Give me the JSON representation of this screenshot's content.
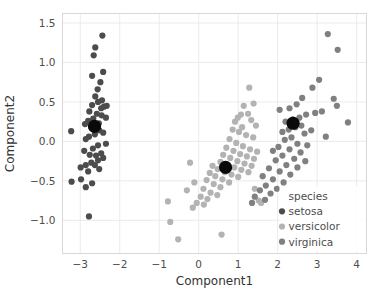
{
  "chart_data": {
    "type": "scatter",
    "title": "",
    "xlabel": "Component1",
    "ylabel": "Component2",
    "xlim": [
      -3.45,
      4.25
    ],
    "ylim": [
      -1.42,
      1.62
    ],
    "xticks": [
      -3,
      -2,
      -1,
      0,
      1,
      2,
      3,
      4
    ],
    "xticklabels": [
      "−3",
      "−2",
      "−1",
      "0",
      "1",
      "2",
      "3",
      "4"
    ],
    "yticks": [
      -1.0,
      -0.5,
      0.0,
      0.5,
      1.0,
      1.5
    ],
    "yticklabels": [
      "−1.0",
      "−0.5",
      "0.0",
      "0.5",
      "1.0",
      "1.5"
    ],
    "grid": true,
    "legend": {
      "title": "species",
      "position": "lower-right",
      "entries": [
        {
          "name": "setosa",
          "color": "#4c4c4c"
        },
        {
          "name": "versicolor",
          "color": "#b3b3b3"
        },
        {
          "name": "virginica",
          "color": "#808080"
        }
      ]
    },
    "marker_size": 3.1,
    "centroid_size": 6.6,
    "centroid_color": "#0a0a0a",
    "series": [
      {
        "name": "setosa",
        "color": "#4c4c4c",
        "points": [
          [
            -2.44,
            1.34
          ],
          [
            -2.62,
            1.19
          ],
          [
            -2.66,
            1.09
          ],
          [
            -2.7,
            0.83
          ],
          [
            -2.42,
            0.88
          ],
          [
            -2.49,
            0.75
          ],
          [
            -2.56,
            0.66
          ],
          [
            -2.62,
            0.57
          ],
          [
            -2.45,
            0.52
          ],
          [
            -2.33,
            0.45
          ],
          [
            -2.4,
            0.44
          ],
          [
            -2.55,
            0.5
          ],
          [
            -2.7,
            0.46
          ],
          [
            -2.77,
            0.38
          ],
          [
            -2.58,
            0.35
          ],
          [
            -2.46,
            0.33
          ],
          [
            -2.35,
            0.3
          ],
          [
            -2.67,
            0.29
          ],
          [
            -2.8,
            0.26
          ],
          [
            -2.88,
            0.22
          ],
          [
            -2.72,
            0.19
          ],
          [
            -2.6,
            0.17
          ],
          [
            -2.52,
            0.14
          ],
          [
            -3.23,
            0.13
          ],
          [
            -2.42,
            0.11
          ],
          [
            -2.63,
            0.09
          ],
          [
            -2.78,
            0.06
          ],
          [
            -2.86,
            0.03
          ],
          [
            -2.35,
            -0.03
          ],
          [
            -2.55,
            -0.05
          ],
          [
            -2.68,
            -0.09
          ],
          [
            -2.9,
            -0.12
          ],
          [
            -2.76,
            -0.17
          ],
          [
            -2.6,
            -0.18
          ],
          [
            -2.47,
            -0.15
          ],
          [
            -2.42,
            -0.21
          ],
          [
            -2.55,
            -0.24
          ],
          [
            -2.72,
            -0.27
          ],
          [
            -2.86,
            -0.3
          ],
          [
            -2.99,
            -0.33
          ],
          [
            -2.63,
            -0.3
          ],
          [
            -2.52,
            -0.35
          ],
          [
            -2.8,
            -0.38
          ],
          [
            -3.22,
            -0.51
          ],
          [
            -2.98,
            -0.48
          ],
          [
            -2.86,
            -0.58
          ],
          [
            -2.7,
            -0.53
          ],
          [
            -2.78,
            -0.95
          ],
          [
            -2.47,
            0.42
          ],
          [
            -2.53,
            0.23
          ]
        ]
      },
      {
        "name": "versicolor",
        "color": "#b3b3b3",
        "points": [
          [
            1.28,
            0.68
          ],
          [
            1.39,
            0.48
          ],
          [
            1.14,
            0.45
          ],
          [
            1.25,
            0.35
          ],
          [
            1.07,
            0.34
          ],
          [
            0.99,
            0.3
          ],
          [
            0.92,
            0.25
          ],
          [
            1.33,
            0.27
          ],
          [
            1.45,
            0.2
          ],
          [
            1.1,
            0.18
          ],
          [
            0.86,
            0.15
          ],
          [
            1.02,
            0.12
          ],
          [
            1.2,
            0.08
          ],
          [
            1.38,
            0.05
          ],
          [
            0.78,
            0.03
          ],
          [
            0.95,
            -0.02
          ],
          [
            1.12,
            -0.06
          ],
          [
            1.3,
            -0.1
          ],
          [
            1.48,
            -0.13
          ],
          [
            0.7,
            -0.08
          ],
          [
            0.88,
            -0.12
          ],
          [
            1.05,
            -0.16
          ],
          [
            1.22,
            -0.19
          ],
          [
            1.4,
            -0.22
          ],
          [
            0.62,
            -0.17
          ],
          [
            0.8,
            -0.21
          ],
          [
            0.98,
            -0.25
          ],
          [
            1.16,
            -0.28
          ],
          [
            1.34,
            -0.31
          ],
          [
            0.55,
            -0.26
          ],
          [
            0.73,
            -0.3
          ],
          [
            0.9,
            -0.33
          ],
          [
            1.08,
            -0.36
          ],
          [
            1.26,
            -0.39
          ],
          [
            0.35,
            -0.31
          ],
          [
            0.48,
            -0.35
          ],
          [
            0.66,
            -0.39
          ],
          [
            0.83,
            -0.42
          ],
          [
            1.0,
            -0.45
          ],
          [
            0.28,
            -0.4
          ],
          [
            0.42,
            -0.44
          ],
          [
            0.6,
            -0.48
          ],
          [
            0.77,
            -0.52
          ],
          [
            0.2,
            -0.49
          ],
          [
            0.38,
            -0.54
          ],
          [
            0.55,
            -0.58
          ],
          [
            0.12,
            -0.6
          ],
          [
            0.3,
            -0.65
          ],
          [
            0.47,
            -0.68
          ],
          [
            -0.22,
            -0.27
          ],
          [
            -0.11,
            -0.52
          ],
          [
            -0.3,
            -0.62
          ],
          [
            0.05,
            -0.7
          ],
          [
            0.22,
            -0.73
          ],
          [
            -0.05,
            -0.78
          ],
          [
            0.13,
            -0.8
          ],
          [
            -0.52,
            -1.24
          ],
          [
            -0.72,
            -1.02
          ],
          [
            -0.78,
            -0.76
          ],
          [
            0.58,
            -1.18
          ],
          [
            -0.15,
            -0.84
          ],
          [
            1.52,
            -0.75
          ],
          [
            1.58,
            -0.78
          ],
          [
            1.42,
            -0.6
          ]
        ]
      },
      {
        "name": "virginica",
        "color": "#808080",
        "points": [
          [
            3.27,
            1.36
          ],
          [
            3.52,
            1.16
          ],
          [
            3.05,
            0.78
          ],
          [
            2.88,
            0.68
          ],
          [
            3.42,
            0.54
          ],
          [
            3.5,
            0.45
          ],
          [
            2.62,
            0.55
          ],
          [
            2.48,
            0.47
          ],
          [
            2.3,
            0.42
          ],
          [
            3.12,
            0.38
          ],
          [
            2.95,
            0.36
          ],
          [
            2.72,
            0.34
          ],
          [
            2.55,
            0.3
          ],
          [
            2.38,
            0.28
          ],
          [
            2.2,
            0.25
          ],
          [
            2.05,
            0.4
          ],
          [
            3.78,
            0.24
          ],
          [
            2.6,
            0.2
          ],
          [
            2.45,
            0.18
          ],
          [
            2.28,
            0.15
          ],
          [
            2.12,
            0.12
          ],
          [
            2.68,
            0.1
          ],
          [
            2.85,
            0.14
          ],
          [
            2.35,
            0.05
          ],
          [
            2.18,
            0.02
          ],
          [
            2.5,
            -0.03
          ],
          [
            2.75,
            -0.05
          ],
          [
            2.02,
            -0.07
          ],
          [
            2.3,
            -0.1
          ],
          [
            2.58,
            -0.14
          ],
          [
            1.88,
            -0.12
          ],
          [
            2.12,
            -0.18
          ],
          [
            2.42,
            -0.22
          ],
          [
            2.7,
            -0.25
          ],
          [
            1.95,
            -0.24
          ],
          [
            2.22,
            -0.3
          ],
          [
            2.5,
            -0.33
          ],
          [
            1.78,
            -0.34
          ],
          [
            2.05,
            -0.38
          ],
          [
            2.32,
            -0.42
          ],
          [
            1.62,
            -0.44
          ],
          [
            1.88,
            -0.48
          ],
          [
            2.15,
            -0.52
          ],
          [
            1.7,
            -0.56
          ],
          [
            1.98,
            -0.6
          ],
          [
            1.55,
            -0.62
          ],
          [
            1.82,
            -0.66
          ],
          [
            1.42,
            -0.7
          ],
          [
            1.68,
            -0.74
          ],
          [
            1.35,
            -0.78
          ],
          [
            3.22,
            0.06
          ]
        ]
      }
    ],
    "centroids": [
      {
        "species": "setosa",
        "x": -2.64,
        "y": 0.19
      },
      {
        "species": "versicolor",
        "x": 0.68,
        "y": -0.33
      },
      {
        "species": "virginica",
        "x": 2.39,
        "y": 0.23
      }
    ]
  }
}
